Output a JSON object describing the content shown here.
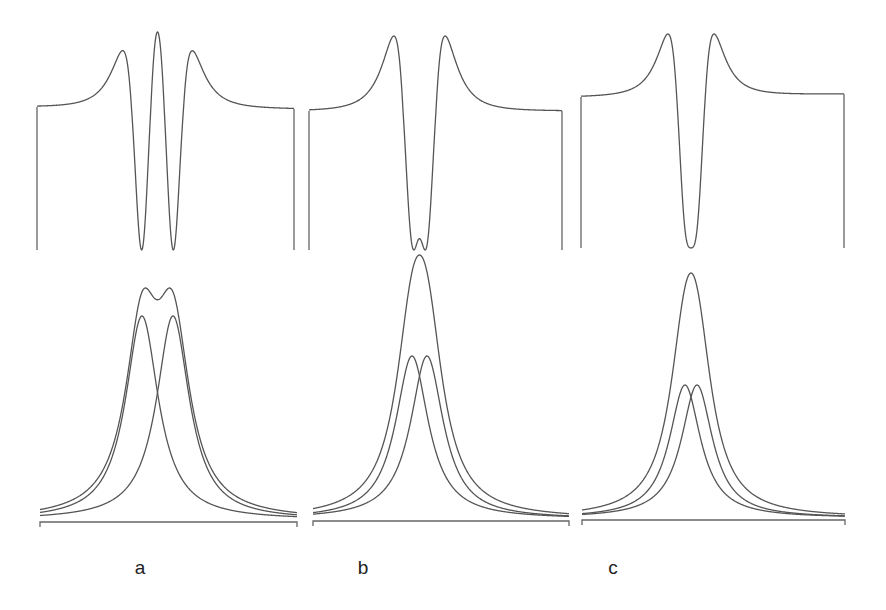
{
  "figure": {
    "panel_labels": [
      "a",
      "b",
      "c"
    ]
  },
  "chart_data": [
    {
      "type": "line",
      "panel": "a",
      "row": "top",
      "title": "",
      "description": "Negative second derivative of the summed band; three maxima resolve both components",
      "series": [
        {
          "name": "second derivative",
          "features": {
            "side_maxima_x": [
              119,
              191
            ],
            "central_max_x": 154,
            "minima_x": [
              142,
              172
            ]
          }
        }
      ],
      "xlabel": "",
      "ylabel": "",
      "grid": false,
      "px": {
        "x0": 37,
        "x1": 294,
        "baseline_left": 107,
        "baseline_right": 109,
        "bottom": 250,
        "top": 32
      }
    },
    {
      "type": "line",
      "panel": "b",
      "row": "top",
      "title": "",
      "description": "Second derivative for closer separation; shallow central bump remains",
      "series": [
        {
          "name": "second derivative",
          "features": {
            "maxima_x": [
              393,
              443
            ],
            "central_bump_x": 419
          }
        }
      ],
      "xlabel": "",
      "ylabel": "",
      "grid": false,
      "px": {
        "x0": 309,
        "x1": 562,
        "baseline_left": 111,
        "baseline_right": 111,
        "bottom": 250,
        "top": 36
      }
    },
    {
      "type": "line",
      "panel": "c",
      "row": "top",
      "title": "",
      "description": "Second derivative for closest separation; components unresolved, single minimum",
      "series": [
        {
          "name": "second derivative",
          "features": {
            "maxima_x": [
              669,
              714
            ],
            "minimum_x": 690
          }
        }
      ],
      "xlabel": "",
      "ylabel": "",
      "grid": false,
      "px": {
        "x0": 581,
        "x1": 844,
        "baseline_left": 97,
        "baseline_right": 94,
        "bottom": 248,
        "top": 34
      }
    },
    {
      "type": "line",
      "panel": "a",
      "row": "bottom",
      "title": "",
      "description": "Two Lorentzian components and their sum (doublet visible)",
      "series": [
        {
          "name": "component 1",
          "center_px": 142,
          "peak_height": 0.88
        },
        {
          "name": "component 2",
          "center_px": 173,
          "peak_height": 0.88
        },
        {
          "name": "sum",
          "maxima_px": [
            145,
            171
          ],
          "peak_height": 1.0
        }
      ],
      "xlabel": "",
      "ylabel": "",
      "grid": false,
      "px": {
        "x0": 40,
        "x1": 297,
        "baseline": 522,
        "sum_top": 288,
        "comp_top": 316
      }
    },
    {
      "type": "line",
      "panel": "b",
      "row": "bottom",
      "title": "",
      "description": "Two Lorentzian components and their sum (single peak)",
      "series": [
        {
          "name": "component 1",
          "center_px": 412,
          "peak_height": 0.62
        },
        {
          "name": "component 2",
          "center_px": 427,
          "peak_height": 0.62
        },
        {
          "name": "sum",
          "maxima_px": [
            419
          ],
          "peak_height": 1.0
        }
      ],
      "xlabel": "",
      "ylabel": "",
      "grid": false,
      "px": {
        "x0": 313,
        "x1": 569,
        "baseline": 521,
        "sum_top": 255,
        "comp_top": 356
      }
    },
    {
      "type": "line",
      "panel": "c",
      "row": "bottom",
      "title": "",
      "description": "Two Lorentzian components and their sum (single peak)",
      "series": [
        {
          "name": "component 1",
          "center_px": 685,
          "peak_height": 0.55
        },
        {
          "name": "component 2",
          "center_px": 697,
          "peak_height": 0.55
        },
        {
          "name": "sum",
          "maxima_px": [
            690
          ],
          "peak_height": 1.0
        }
      ],
      "xlabel": "",
      "ylabel": "",
      "grid": false,
      "px": {
        "x0": 582,
        "x1": 845,
        "baseline": 520,
        "sum_top": 273,
        "comp_top": 385
      }
    }
  ],
  "model": {
    "panels": [
      {
        "id": "a",
        "label_x": 140,
        "center": 157.5,
        "sep": 31,
        "hw": 20,
        "top": {
          "x0": 37,
          "x1": 294,
          "yb0": 107,
          "yb1": 109,
          "ybot": 250,
          "ytop": 32
        },
        "bottom": {
          "x0": 40,
          "x1": 297,
          "yb": 522,
          "sumTop": 288,
          "compTop": 316
        }
      },
      {
        "id": "b",
        "label_x": 363,
        "center": 419.5,
        "sep": 15,
        "hw": 20,
        "top": {
          "x0": 309,
          "x1": 562,
          "yb0": 111,
          "yb1": 111,
          "ybot": 250,
          "ytop": 36
        },
        "bottom": {
          "x0": 313,
          "x1": 569,
          "yb": 521,
          "sumTop": 255,
          "compTop": 356
        }
      },
      {
        "id": "c",
        "label_x": 613,
        "center": 691,
        "sep": 12,
        "hw": 19,
        "top": {
          "x0": 581,
          "x1": 844,
          "yb0": 97,
          "yb1": 94,
          "ybot": 248,
          "ytop": 34
        },
        "bottom": {
          "x0": 582,
          "x1": 845,
          "yb": 520,
          "sumTop": 273,
          "compTop": 385
        }
      }
    ],
    "label_y": 566
  }
}
